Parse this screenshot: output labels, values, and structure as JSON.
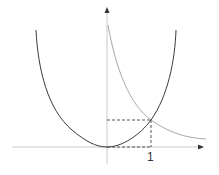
{
  "diagram": {
    "type": "function-graph",
    "colors": {
      "background": "#ffffff",
      "axis": "#c8c8c8",
      "axis_arrow": "#333333",
      "parabola": "#3a3a3a",
      "decreasing_curve": "#a8a8a8",
      "dashed_guides": "#444444",
      "label": "#333333"
    },
    "axes": {
      "x_axis": {
        "has_arrow": true
      },
      "y_axis": {
        "has_arrow": true
      }
    },
    "curves": [
      {
        "name": "parabola",
        "description": "U-shaped curve with vertex at origin",
        "passes_through": [
          [
            0,
            0
          ],
          [
            1,
            1
          ]
        ]
      },
      {
        "name": "decreasing-curve",
        "description": "decreasing curve in first quadrant approaching x-axis",
        "passes_through": [
          [
            1,
            1
          ]
        ]
      }
    ],
    "intersection_point": {
      "x": 1,
      "y": 1
    },
    "guides": {
      "style": "dashed",
      "from_origin_to": [
        1,
        1
      ]
    },
    "tick_labels": {
      "x_one": "1"
    }
  }
}
